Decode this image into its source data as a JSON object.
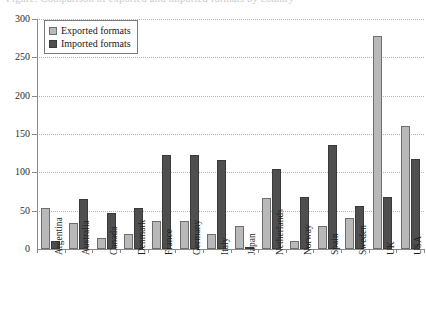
{
  "caption": {
    "text": "Figure: Comparison of exported and imported formats by country"
  },
  "chart_data": {
    "type": "bar",
    "title": "",
    "xlabel": "",
    "ylabel": "",
    "ylim": [
      0,
      300
    ],
    "yticks": [
      0,
      50,
      100,
      150,
      200,
      250,
      300
    ],
    "ytick_labels": [
      "0",
      "50",
      "100",
      "150",
      "200",
      "250",
      "300"
    ],
    "grid": true,
    "grid_style": "dotted-horizontal",
    "legend_position": "upper-left",
    "categories": [
      "Argentina",
      "Australia",
      "Canada",
      "Denmark",
      "France",
      "Germany",
      "Italy",
      "Japan",
      "Netherlands",
      "Norway",
      "Spain",
      "Sweden",
      "UK",
      "USA"
    ],
    "series": [
      {
        "name": "Exported formats",
        "color": "#b9b9b9",
        "values": [
          54,
          34,
          15,
          20,
          36,
          36,
          19,
          30,
          67,
          11,
          30,
          41,
          278,
          160
        ]
      },
      {
        "name": "Imported formats",
        "color": "#4f4f4f",
        "values": [
          11,
          65,
          47,
          54,
          122,
          122,
          116,
          2,
          104,
          68,
          136,
          56,
          68,
          117
        ]
      }
    ]
  },
  "legend": {
    "items": [
      {
        "label": "Exported formats",
        "swatch": "exported"
      },
      {
        "label": "Imported formats",
        "swatch": "imported"
      }
    ]
  }
}
